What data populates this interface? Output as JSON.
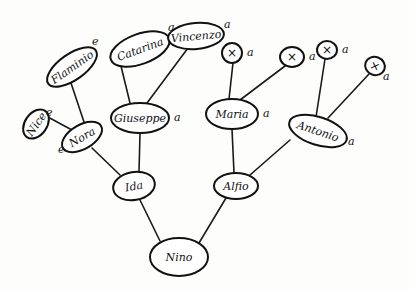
{
  "diagram": {
    "type": "family-tree",
    "style": "hand-drawn",
    "colors": {
      "ink": "#111111",
      "paper": "#fdfdfc"
    },
    "nodes": [
      {
        "id": "nino",
        "label": "Nino",
        "cx": 179,
        "cy": 257,
        "rx": 29,
        "ry": 19,
        "rot": 0,
        "mark": ""
      },
      {
        "id": "ida",
        "label": "Ida",
        "cx": 134,
        "cy": 186,
        "rx": 21,
        "ry": 14,
        "rot": -10,
        "mark": ""
      },
      {
        "id": "alfio",
        "label": "Alfio",
        "cx": 236,
        "cy": 186,
        "rx": 22,
        "ry": 13,
        "rot": 0,
        "mark": ""
      },
      {
        "id": "nora",
        "label": "Nora",
        "cx": 82,
        "cy": 137,
        "rx": 22,
        "ry": 12,
        "rot": -30,
        "mark": "e"
      },
      {
        "id": "giuseppe",
        "label": "Giuseppe",
        "cx": 140,
        "cy": 118,
        "rx": 29,
        "ry": 15,
        "rot": 0,
        "mark": "a"
      },
      {
        "id": "maria",
        "label": "Maria",
        "cx": 232,
        "cy": 114,
        "rx": 26,
        "ry": 15,
        "rot": 0,
        "mark": "a"
      },
      {
        "id": "antonio",
        "label": "Antonio",
        "cx": 318,
        "cy": 131,
        "rx": 30,
        "ry": 14,
        "rot": 18,
        "mark": "a"
      },
      {
        "id": "nice",
        "label": "Nice",
        "cx": 36,
        "cy": 124,
        "rx": 16,
        "ry": 11,
        "rot": -55,
        "mark": "e"
      },
      {
        "id": "flaminio",
        "label": "Flaminio",
        "cx": 72,
        "cy": 67,
        "rx": 29,
        "ry": 13,
        "rot": -35,
        "mark": "e"
      },
      {
        "id": "catarina",
        "label": "Catarina",
        "cx": 140,
        "cy": 49,
        "rx": 31,
        "ry": 15,
        "rot": -20,
        "mark": "a"
      },
      {
        "id": "vincenzo",
        "label": "Vincenzo",
        "cx": 196,
        "cy": 36,
        "rx": 28,
        "ry": 13,
        "rot": -5,
        "mark": "a"
      },
      {
        "id": "x1",
        "label": "×",
        "cx": 232,
        "cy": 53,
        "rx": 10,
        "ry": 10,
        "rot": 0,
        "mark": "a"
      },
      {
        "id": "x2",
        "label": "×",
        "cx": 292,
        "cy": 57,
        "rx": 12,
        "ry": 10,
        "rot": 0,
        "mark": "a"
      },
      {
        "id": "x3",
        "label": "×",
        "cx": 327,
        "cy": 50,
        "rx": 10,
        "ry": 9,
        "rot": 0,
        "mark": "a"
      },
      {
        "id": "x4",
        "label": "×",
        "cx": 375,
        "cy": 66,
        "rx": 10,
        "ry": 9,
        "rot": 20,
        "mark": "a"
      }
    ],
    "edges": [
      {
        "from": "nino",
        "to": "ida",
        "x1": 160,
        "y1": 241,
        "x2": 140,
        "y2": 200
      },
      {
        "from": "nino",
        "to": "alfio",
        "x1": 199,
        "y1": 243,
        "x2": 226,
        "y2": 198
      },
      {
        "from": "ida",
        "to": "nora",
        "x1": 120,
        "y1": 175,
        "x2": 92,
        "y2": 148
      },
      {
        "from": "ida",
        "to": "giuseppe",
        "x1": 139,
        "y1": 172,
        "x2": 140,
        "y2": 133
      },
      {
        "from": "alfio",
        "to": "maria",
        "x1": 234,
        "y1": 173,
        "x2": 232,
        "y2": 129
      },
      {
        "from": "alfio",
        "to": "antonio",
        "x1": 250,
        "y1": 175,
        "x2": 290,
        "y2": 140
      },
      {
        "from": "nora",
        "to": "nice",
        "x1": 72,
        "y1": 130,
        "x2": 46,
        "y2": 116
      },
      {
        "from": "nora",
        "to": "flaminio",
        "x1": 85,
        "y1": 125,
        "x2": 70,
        "y2": 80
      },
      {
        "from": "giuseppe",
        "to": "catarina",
        "x1": 130,
        "y1": 103,
        "x2": 120,
        "y2": 62
      },
      {
        "from": "giuseppe",
        "to": "vincenzo",
        "x1": 147,
        "y1": 103,
        "x2": 188,
        "y2": 48
      },
      {
        "from": "maria",
        "to": "x1",
        "x1": 229,
        "y1": 99,
        "x2": 233,
        "y2": 63
      },
      {
        "from": "maria",
        "to": "x2",
        "x1": 240,
        "y1": 100,
        "x2": 285,
        "y2": 66
      },
      {
        "from": "antonio",
        "to": "x3",
        "x1": 316,
        "y1": 117,
        "x2": 325,
        "y2": 59
      },
      {
        "from": "antonio",
        "to": "x4",
        "x1": 328,
        "y1": 118,
        "x2": 369,
        "y2": 74
      }
    ]
  }
}
